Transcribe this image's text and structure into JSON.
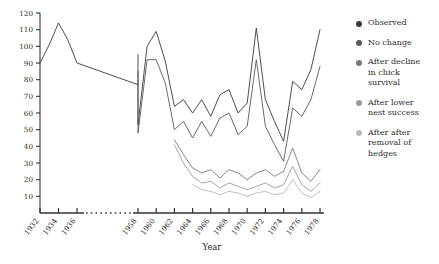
{
  "chart_data": {
    "type": "line",
    "title": "",
    "xlabel": "Year",
    "ylabel": "",
    "ylim": [
      0,
      120
    ],
    "yticks": [
      10,
      20,
      30,
      40,
      50,
      60,
      70,
      80,
      90,
      100,
      110,
      120
    ],
    "xlim": [
      1932,
      1978
    ],
    "xticks": [
      1932,
      1934,
      1936,
      1958,
      1960,
      1962,
      1964,
      1966,
      1968,
      1970,
      1972,
      1974,
      1976,
      1978
    ],
    "xtick_labels": [
      "1932",
      "1934",
      "1936",
      "1958",
      "1960",
      "1962",
      "1964",
      "1966",
      "1968",
      "1970",
      "1972",
      "1974",
      "1976",
      "1978"
    ],
    "axis_break": {
      "from": 1936.6,
      "to": 1957.4,
      "style": "dotted"
    },
    "grid": false,
    "legend_position": "right",
    "series": [
      {
        "name": "Observed",
        "color": "#3a3a3a",
        "segments": [
          {
            "x": [
              1932,
              1933,
              1934,
              1935,
              1936,
              1937
            ],
            "y": [
              90,
              101,
              114,
              104,
              90,
              77
            ]
          },
          {
            "x": [
              1957,
              1958,
              1959,
              1960,
              1961,
              1962,
              1963,
              1964,
              1965,
              1966,
              1967,
              1968,
              1969,
              1970,
              1971,
              1972,
              1973,
              1974,
              1975,
              1976,
              1977,
              1978
            ],
            "y": [
              95,
              53,
              100,
              109,
              91,
              64,
              68,
              60,
              68,
              58,
              71,
              74,
              60,
              66,
              111,
              68,
              55,
              43,
              79,
              74,
              86,
              110,
              57
            ]
          }
        ]
      },
      {
        "name": "No change",
        "color": "#5a5a5a",
        "segments": [
          {
            "x": [
              1957,
              1958,
              1959,
              1960,
              1961,
              1962,
              1963,
              1964,
              1965,
              1966,
              1967,
              1968,
              1969,
              1970,
              1971,
              1972,
              1973,
              1974,
              1975,
              1976,
              1977,
              1978
            ],
            "y": [
              85,
              48,
              92,
              92,
              78,
              50,
              55,
              45,
              55,
              46,
              57,
              60,
              47,
              52,
              92,
              52,
              41,
              31,
              63,
              58,
              68,
              88,
              44
            ]
          }
        ]
      },
      {
        "name": "After decline\nin chick\nsurvival",
        "color": "#7a7a7a",
        "segments": [
          {
            "x": [
              1962,
              1963,
              1964,
              1965,
              1966,
              1967,
              1968,
              1969,
              1970,
              1971,
              1972,
              1973,
              1974,
              1975,
              1976,
              1977,
              1978
            ],
            "y": [
              44,
              35,
              27,
              24,
              26,
              21,
              26,
              24,
              20,
              24,
              26,
              22,
              25,
              39,
              24,
              19,
              26,
              32,
              22,
              14
            ]
          }
        ]
      },
      {
        "name": "After lower\nnest success",
        "color": "#9a9a9a",
        "segments": [
          {
            "x": [
              1962,
              1963,
              1964,
              1965,
              1966,
              1967,
              1968,
              1969,
              1970,
              1971,
              1972,
              1973,
              1974,
              1975,
              1976,
              1977,
              1978
            ],
            "y": [
              41,
              30,
              22,
              18,
              19,
              15,
              18,
              16,
              14,
              16,
              18,
              15,
              17,
              28,
              17,
              13,
              18,
              23,
              15,
              9
            ]
          }
        ]
      },
      {
        "name": "After after\nremoval of\nhedges",
        "color": "#b8b8b8",
        "segments": [
          {
            "x": [
              1964,
              1965,
              1966,
              1967,
              1968,
              1969,
              1970,
              1971,
              1972,
              1973,
              1974,
              1975,
              1976,
              1977,
              1978
            ],
            "y": [
              17,
              14,
              13,
              11,
              13,
              12,
              10,
              12,
              13,
              11,
              12,
              20,
              12,
              9,
              13,
              17,
              11,
              6
            ]
          }
        ]
      }
    ]
  },
  "legend": {
    "items": [
      {
        "label": "Observed",
        "color": "#3a3a3a"
      },
      {
        "label": "No change",
        "color": "#5a5a5a"
      },
      {
        "label": "After decline\nin chick\nsurvival",
        "color": "#7a7a7a"
      },
      {
        "label": "After lower\nnest success",
        "color": "#9a9a9a"
      },
      {
        "label": "After after\nremoval of\nhedges",
        "color": "#b8b8b8"
      }
    ]
  }
}
